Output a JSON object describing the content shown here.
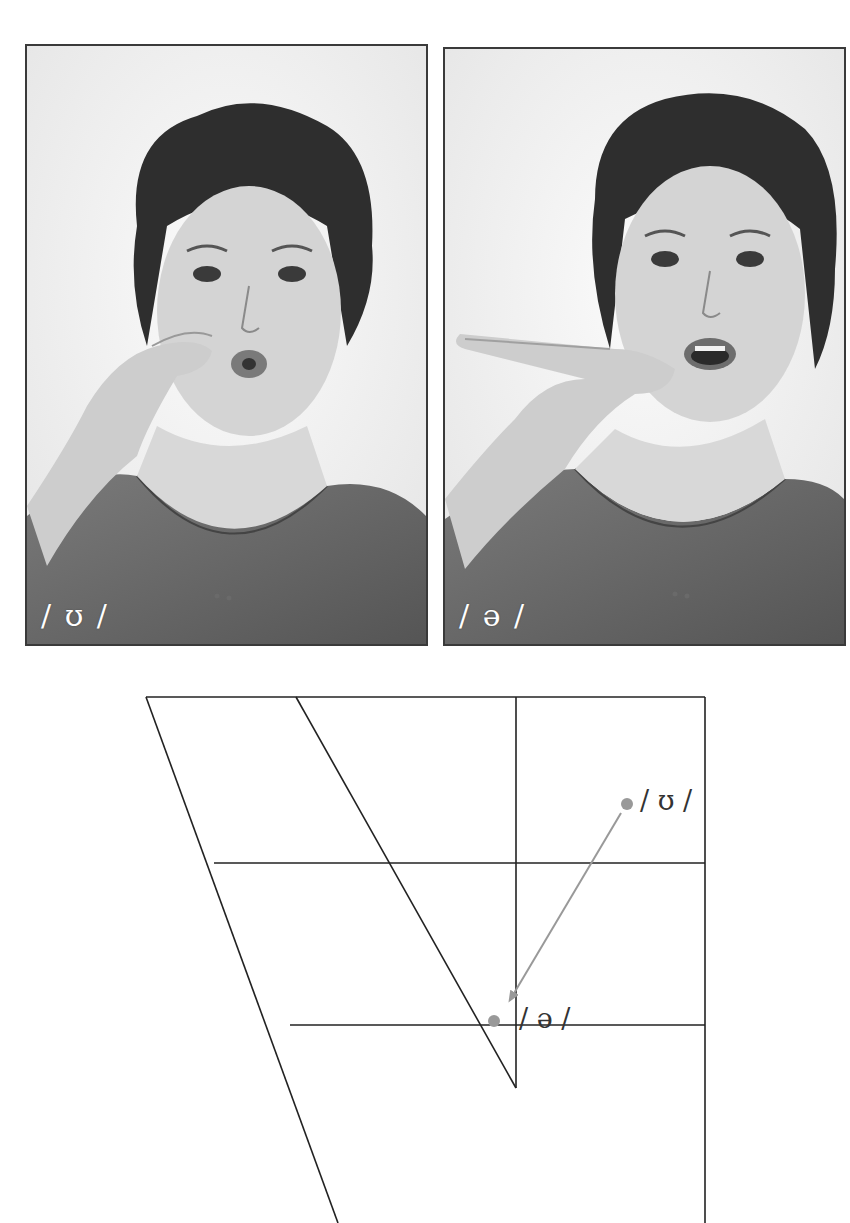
{
  "diagram": {
    "type": "vowel-quadrilateral-diphthong",
    "photos": [
      {
        "id": "left",
        "label": "/ ʊ /",
        "description": "woman with rounded lips, hand gesture near cheek"
      },
      {
        "id": "right",
        "label": "/ ə /",
        "description": "woman with mouth open relaxed, hand gesture below chin"
      }
    ],
    "chart": {
      "points": [
        {
          "symbol": "/ ʊ /",
          "role": "start",
          "color": "#999999"
        },
        {
          "symbol": "/ ə /",
          "role": "end",
          "color": "#999999"
        }
      ],
      "arrow": {
        "from": "/ ʊ /",
        "to": "/ ə /",
        "color": "#999999"
      },
      "line_color": "#222222"
    }
  }
}
